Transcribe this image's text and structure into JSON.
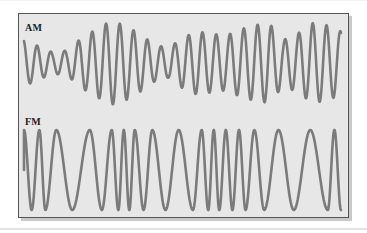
{
  "diagram": {
    "colors": {
      "background": "#e7e7e7",
      "border": "#555555",
      "wave": "#7b7b7b"
    },
    "am": {
      "label": "AM",
      "description": "Amplitude modulated carrier: constant frequency, varying amplitude",
      "carrier_cycles": 23,
      "relative_peak_amplitudes": [
        0.55,
        0.4,
        0.25,
        0.3,
        0.6,
        0.8,
        1.0,
        0.9,
        0.7,
        0.45,
        0.35,
        0.6,
        0.75,
        0.7,
        0.65,
        0.8,
        0.9,
        0.95,
        0.55,
        0.7,
        0.95,
        0.9,
        0.75
      ]
    },
    "fm": {
      "label": "FM",
      "description": "Frequency modulated carrier: constant amplitude, varying frequency",
      "relative_half_periods": [
        0.7,
        0.7,
        0.55,
        1.0,
        1.45,
        1.6,
        1.1,
        0.9,
        0.6,
        0.5,
        0.5,
        0.5,
        0.8,
        0.8,
        1.2,
        1.2,
        1.3,
        0.8,
        0.6,
        0.5,
        0.5,
        0.6,
        0.6,
        0.6,
        0.6,
        0.8,
        0.9,
        1.3,
        1.4,
        1.5,
        1.6,
        0.6,
        0.6
      ]
    }
  }
}
